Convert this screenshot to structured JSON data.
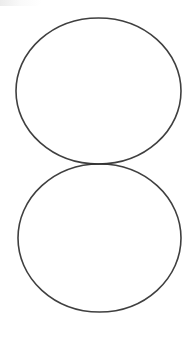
{
  "diagram": {
    "background": "#ffffff",
    "stroke_color": "#2a2a2a",
    "stroke_width": 1.6,
    "shapes": [
      {
        "id": "top-ellipse",
        "type": "ellipse",
        "cx": 98.5,
        "cy": 91,
        "rx": 82.5,
        "ry": 73
      },
      {
        "id": "bottom-ellipse",
        "type": "ellipse",
        "cx": 99.5,
        "cy": 238,
        "rx": 81.5,
        "ry": 74
      }
    ],
    "touch_point": {
      "x": 99,
      "y": 164
    }
  }
}
